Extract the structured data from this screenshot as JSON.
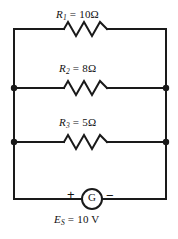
{
  "diagram": {
    "type": "electrical-circuit-schematic",
    "stroke_color": "#1a1a1a",
    "background_color": "#ffffff",
    "components": [
      {
        "id": "r1",
        "kind": "resistor",
        "symbol": "R",
        "subscript": "1",
        "equals": "=",
        "value": "10",
        "unit": "Ω",
        "label": "R1 = 10 Ω"
      },
      {
        "id": "r2",
        "kind": "resistor",
        "symbol": "R",
        "subscript": "2",
        "equals": "=",
        "value": "8",
        "unit": "Ω",
        "label": "R2 = 8 Ω"
      },
      {
        "id": "r3",
        "kind": "resistor",
        "symbol": "R",
        "subscript": "3",
        "equals": "=",
        "value": "5",
        "unit": "Ω",
        "label": "R3 = 5 Ω"
      },
      {
        "id": "source",
        "kind": "generator",
        "symbol": "E",
        "subscript": "S",
        "equals": "=",
        "value": "10",
        "unit": "V",
        "label": "ES = 10 V",
        "glyph": "G",
        "terminal_positive": "+",
        "terminal_negative": "−"
      }
    ],
    "junction_dots": 4
  }
}
